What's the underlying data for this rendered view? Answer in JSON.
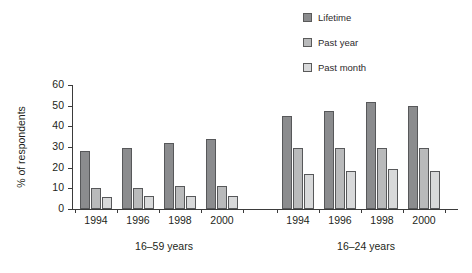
{
  "chart_data": {
    "type": "bar",
    "title": "",
    "subtitle": "",
    "xlabel": "",
    "ylabel": "% of respondents",
    "ylim": [
      0,
      60
    ],
    "yticks": [
      0,
      10,
      20,
      30,
      40,
      50,
      60
    ],
    "grid": false,
    "legend_position": "top-right",
    "legend": [
      "Lifetime",
      "Past year",
      "Past month"
    ],
    "colors": {
      "lifetime": "#8b8c8e",
      "past_year": "#b9babb",
      "past_month": "#d8d9da",
      "outline": "#57585a",
      "axis": "#3b3b3b",
      "text": "#231f20",
      "background": "#ffffff"
    },
    "groups": [
      {
        "name": "16–59 years",
        "categories": [
          "1994",
          "1996",
          "1998",
          "2000"
        ],
        "series": [
          {
            "name": "Lifetime",
            "values": [
              28.0,
              29.5,
              32.0,
              34.0
            ]
          },
          {
            "name": "Past year",
            "values": [
              10.0,
              10.2,
              11.2,
              11.3
            ]
          },
          {
            "name": "Past month",
            "values": [
              6.0,
              6.2,
              6.2,
              6.4
            ]
          }
        ]
      },
      {
        "name": "16–24 years",
        "categories": [
          "1994",
          "1996",
          "1998",
          "2000"
        ],
        "series": [
          {
            "name": "Lifetime",
            "values": [
              45.0,
              47.2,
              52.0,
              50.0
            ]
          },
          {
            "name": "Past year",
            "values": [
              29.3,
              29.4,
              29.4,
              29.5
            ]
          },
          {
            "name": "Past month",
            "values": [
              17.0,
              18.2,
              19.2,
              18.2
            ]
          }
        ]
      }
    ]
  },
  "legend": {
    "items": [
      {
        "label": "Lifetime",
        "color": "#8b8c8e"
      },
      {
        "label": "Past year",
        "color": "#b9babb"
      },
      {
        "label": "Past month",
        "color": "#d8d9da"
      }
    ]
  },
  "axes": {
    "y_label": "% of respondents",
    "y_ticks": [
      "0",
      "10",
      "20",
      "30",
      "40",
      "50",
      "60"
    ]
  },
  "groups": [
    {
      "label": "16–59 years",
      "years": [
        "1994",
        "1996",
        "1998",
        "2000"
      ]
    },
    {
      "label": "16–24 years",
      "years": [
        "1994",
        "1996",
        "1998",
        "2000"
      ]
    }
  ]
}
